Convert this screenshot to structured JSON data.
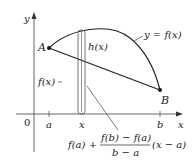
{
  "diagram": {
    "axes": {
      "y_label": "y",
      "x_label": "x",
      "origin_label": "0"
    },
    "ticks": {
      "a": "a",
      "x": "x",
      "b": "b"
    },
    "points": {
      "A": "A",
      "B": "B"
    },
    "labels": {
      "curve": "y = f(x)",
      "h": "h(x)",
      "f": "f(x)"
    },
    "formula": {
      "lead": "f(a) +",
      "numerator": "f(b) − f(a)",
      "denominator": "b − a",
      "trail": "(x − a)"
    },
    "colors": {
      "ink": "#222222",
      "axis": "#555555",
      "background": "#ffffff"
    }
  }
}
